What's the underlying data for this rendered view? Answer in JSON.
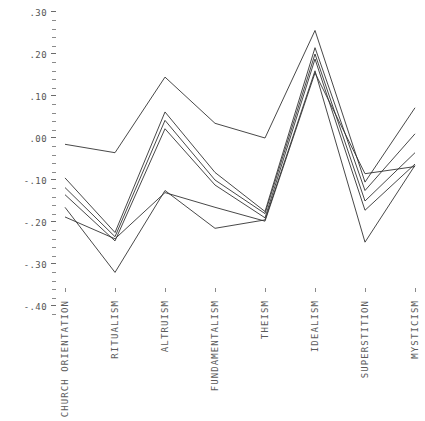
{
  "chart_data": {
    "type": "line",
    "title": "",
    "subtitle": "",
    "xlabel": "",
    "ylabel": "",
    "categories": [
      "CHURCH ORIENTATION",
      "RITUALISM",
      "ALTRUISM",
      "FUNDAMENTALISM",
      "THEISM",
      "IDEALISM",
      "SUPERSTITION",
      "MYSTICISM"
    ],
    "ylim": [
      -0.4,
      0.3
    ],
    "ytick_labels": [
      ".30",
      ".20",
      ".10",
      ".00",
      "-.10",
      "-.20",
      "-.30",
      "-.40"
    ],
    "ytick_values": [
      0.3,
      0.2,
      0.1,
      0.0,
      -0.1,
      -0.2,
      -0.3,
      -0.4
    ],
    "minor_ticks_per_interval": 4,
    "grid": false,
    "legend": "none",
    "line_color": "#333333",
    "line_width": 0.9,
    "series": [
      {
        "name": "series-1",
        "values": [
          -0.015,
          -0.035,
          0.145,
          0.035,
          0.0,
          0.256,
          -0.105,
          0.072
        ]
      },
      {
        "name": "series-2",
        "values": [
          -0.095,
          -0.225,
          0.062,
          -0.082,
          -0.175,
          0.215,
          -0.125,
          0.01
        ]
      },
      {
        "name": "series-3",
        "values": [
          -0.118,
          -0.235,
          0.042,
          -0.1,
          -0.18,
          0.2,
          -0.15,
          -0.035
        ]
      },
      {
        "name": "series-4",
        "values": [
          -0.135,
          -0.245,
          0.022,
          -0.112,
          -0.19,
          0.188,
          -0.172,
          -0.062
        ]
      },
      {
        "name": "series-5",
        "values": [
          -0.165,
          -0.32,
          -0.125,
          -0.215,
          -0.195,
          0.16,
          -0.248,
          -0.065
        ]
      },
      {
        "name": "series-6",
        "values": [
          -0.188,
          -0.24,
          -0.13,
          -0.165,
          -0.198,
          0.155,
          -0.085,
          -0.068
        ]
      }
    ]
  }
}
